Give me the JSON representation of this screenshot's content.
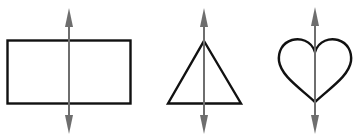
{
  "diagram": {
    "shape_stroke": "#111111",
    "axis_color": "#6e6e6e",
    "shapes": [
      {
        "name": "rectangle",
        "axis": "vertical"
      },
      {
        "name": "triangle",
        "axis": "vertical"
      },
      {
        "name": "heart",
        "axis": "vertical"
      }
    ]
  }
}
